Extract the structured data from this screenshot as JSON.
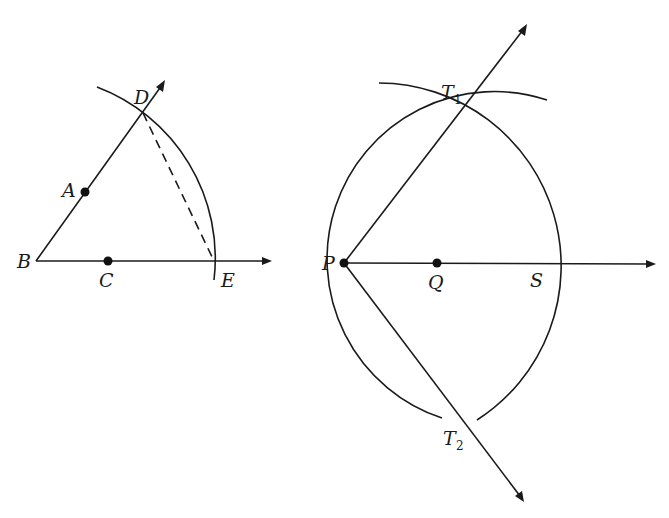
{
  "figure_left": {
    "title": "Constructing equal segments on two rays",
    "points": {
      "B": {
        "label": "B",
        "x": 36,
        "y": 261
      },
      "A": {
        "label": "A",
        "x": 85,
        "y": 192
      },
      "C": {
        "label": "C",
        "x": 108,
        "y": 261
      },
      "D": {
        "label": "D",
        "x": 143,
        "y": 113
      },
      "E": {
        "label": "E",
        "x": 214,
        "y": 261
      }
    },
    "rays": [
      "BD",
      "BE"
    ],
    "dashed_segment": "DE",
    "arc": "centered at B through D and E"
  },
  "figure_right": {
    "title": "Tangents from an external point",
    "points": {
      "P": {
        "label": "P",
        "x": 344,
        "y": 263
      },
      "Q": {
        "label": "Q",
        "x": 437,
        "y": 263
      },
      "S": {
        "label": "S",
        "x": 526,
        "y": 263
      },
      "T1": {
        "label": "T",
        "subscript": "1",
        "x": 455,
        "y": 115
      },
      "T2": {
        "label": "T",
        "subscript": "2",
        "x": 454,
        "y": 411
      }
    },
    "rays": [
      "PT1",
      "PT2",
      "PS"
    ],
    "arcs": [
      "centered at P through S",
      "centered at S through P-side"
    ]
  },
  "colors": {
    "stroke": "#1a1a1a",
    "background": "#ffffff"
  }
}
